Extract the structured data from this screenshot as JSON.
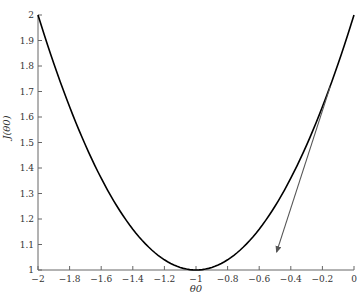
{
  "chart_data": {
    "type": "line",
    "title": "",
    "xlabel": "θ0",
    "ylabel": "J(θ0)",
    "xlim": [
      -2,
      0
    ],
    "ylim": [
      1,
      2
    ],
    "grid": false,
    "legend": null,
    "xticks": [
      -2,
      -1.8,
      -1.6,
      -1.4,
      -1.2,
      -1,
      -0.8,
      -0.6,
      -0.4,
      -0.2,
      0
    ],
    "xtick_labels": [
      "−2",
      "−1.8",
      "−1.6",
      "−1.4",
      "−1.2",
      "−1",
      "−0.8",
      "−0.6",
      "−0.4",
      "−0.2",
      "0"
    ],
    "yticks": [
      1,
      1.1,
      1.2,
      1.3,
      1.4,
      1.5,
      1.6,
      1.7,
      1.8,
      1.9,
      2
    ],
    "ytick_labels": [
      "1",
      "1.1",
      "1.2",
      "1.3",
      "1.4",
      "1.5",
      "1.6",
      "1.7",
      "1.8",
      "1.9",
      "2"
    ],
    "series": [
      {
        "name": "J(θ0) = (θ0 + 1)^2 + 1",
        "color": "#000000",
        "x": [
          -2,
          -1.8,
          -1.6,
          -1.4,
          -1.2,
          -1,
          -0.8,
          -0.6,
          -0.4,
          -0.2,
          0
        ],
        "values": [
          2,
          1.64,
          1.36,
          1.16,
          1.04,
          1,
          1.04,
          1.16,
          1.36,
          1.64,
          2
        ]
      }
    ],
    "annotations": [
      {
        "type": "arrow",
        "color": "#555555",
        "from": [
          -0.15,
          1.72
        ],
        "to": [
          -0.49,
          1.07
        ],
        "description": "gradient / tangent direction arrow"
      }
    ]
  }
}
